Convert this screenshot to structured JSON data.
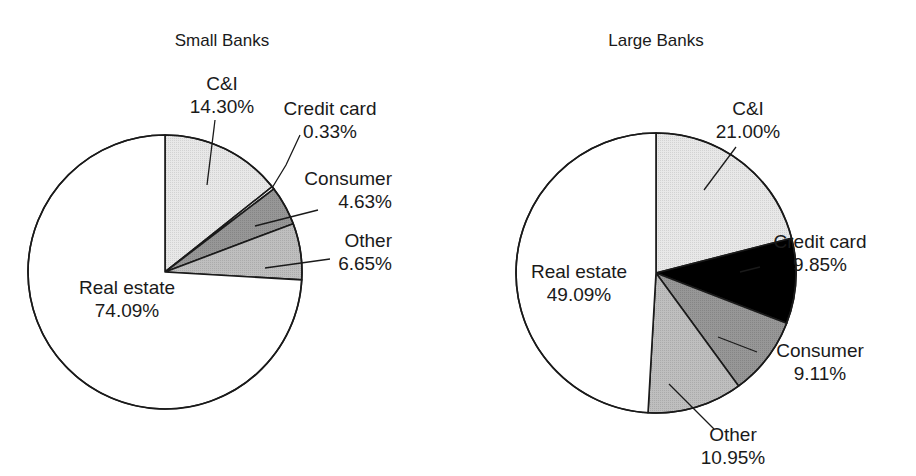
{
  "figure": {
    "background": "#ffffff",
    "outline_color": "#1a1a1a"
  },
  "charts": [
    {
      "id": "small-banks",
      "title": "Small Banks",
      "center": {
        "x": 165,
        "y": 272
      },
      "radius": 137,
      "start_angle_deg": 0,
      "slices": [
        {
          "label": "C&I",
          "value": 14.3,
          "value_text": "14.30%",
          "color": "#e4e4e4"
        },
        {
          "label": "Credit card",
          "value": 0.33,
          "value_text": "0.33%",
          "color": "#ffffff"
        },
        {
          "label": "Consumer",
          "value": 4.63,
          "value_text": "4.63%",
          "color": "#8f8f8f"
        },
        {
          "label": "Other",
          "value": 6.65,
          "value_text": "6.65%",
          "color": "#b9b9b9"
        },
        {
          "label": "Real estate",
          "value": 74.09,
          "value_text": "74.09%",
          "color": "#ffffff"
        }
      ],
      "labels": [
        {
          "name": "ci",
          "line1": "C&I",
          "line2": "14.30%",
          "x": 222,
          "y": 90,
          "anchor": "middle",
          "leader": [
            [
              215,
              120
            ],
            [
              207,
              185
            ]
          ]
        },
        {
          "name": "credit-card",
          "line1": "Credit card",
          "line2": "0.33%",
          "x": 330,
          "y": 115,
          "anchor": "middle",
          "leader": [
            [
              300,
              135
            ],
            [
              286,
              165
            ],
            [
              272,
              188
            ]
          ]
        },
        {
          "name": "consumer",
          "line1": "Consumer",
          "line2": "4.63%",
          "x": 392,
          "y": 185,
          "anchor": "end",
          "leader": [
            [
              318,
              210
            ],
            [
              255,
              226
            ]
          ]
        },
        {
          "name": "other",
          "line1": "Other",
          "line2": "6.65%",
          "x": 392,
          "y": 247,
          "anchor": "end",
          "leader": [
            [
              330,
              259
            ],
            [
              265,
              268
            ]
          ]
        },
        {
          "name": "real-estate",
          "line1": "Real estate",
          "line2": "74.09%",
          "x": 127,
          "y": 294,
          "anchor": "middle",
          "leader": null
        }
      ]
    },
    {
      "id": "large-banks",
      "title": "Large Banks",
      "center": {
        "x": 656,
        "y": 273
      },
      "radius": 140,
      "start_angle_deg": 0,
      "slices": [
        {
          "label": "C&I",
          "value": 21.0,
          "value_text": "21.00%",
          "color": "#e4e4e4"
        },
        {
          "label": "Credit card",
          "value": 9.85,
          "value_text": "9.85%",
          "color": "#000000"
        },
        {
          "label": "Consumer",
          "value": 9.11,
          "value_text": "9.11%",
          "color": "#8f8f8f"
        },
        {
          "label": "Other",
          "value": 10.95,
          "value_text": "10.95%",
          "color": "#b9b9b9"
        },
        {
          "label": "Real estate",
          "value": 49.09,
          "value_text": "49.09%",
          "color": "#ffffff"
        }
      ],
      "labels": [
        {
          "name": "ci",
          "line1": "C&I",
          "line2": "21.00%",
          "x": 748,
          "y": 115,
          "anchor": "middle",
          "leader": [
            [
              736,
              147
            ],
            [
              704,
              190
            ]
          ]
        },
        {
          "name": "credit-card",
          "line1": "Credit card",
          "line2": "9.85%",
          "x": 820,
          "y": 248,
          "anchor": "middle",
          "leader": [
            [
              760,
              267
            ],
            [
              740,
              272
            ]
          ]
        },
        {
          "name": "consumer",
          "line1": "Consumer",
          "line2": "9.11%",
          "x": 820,
          "y": 357,
          "anchor": "middle",
          "leader": [
            [
              757,
              352
            ],
            [
              718,
              337
            ]
          ]
        },
        {
          "name": "other",
          "line1": "Other",
          "line2": "10.95%",
          "x": 733,
          "y": 441,
          "anchor": "middle",
          "leader": [
            [
              714,
              429
            ],
            [
              669,
              384
            ]
          ]
        },
        {
          "name": "real-estate",
          "line1": "Real estate",
          "line2": "49.09%",
          "x": 579,
          "y": 278,
          "anchor": "middle",
          "leader": null
        }
      ]
    }
  ],
  "chart_data": {
    "type": "pie",
    "xlabel": "",
    "ylabel": "",
    "units": "percent",
    "legend": "none",
    "grid": false,
    "categories": [
      "C&I",
      "Credit card",
      "Consumer",
      "Other",
      "Real estate"
    ],
    "series": [
      {
        "name": "Small Banks",
        "values": [
          14.3,
          0.33,
          4.63,
          6.65,
          74.09
        ]
      },
      {
        "name": "Large Banks",
        "values": [
          21.0,
          9.85,
          9.11,
          10.95,
          49.09
        ]
      }
    ],
    "annotations": [
      "Small Banks: C&I 14.30%",
      "Small Banks: Credit card 0.33%",
      "Small Banks: Consumer 4.63%",
      "Small Banks: Other 6.65%",
      "Small Banks: Real estate 74.09%",
      "Large Banks: C&I 21.00%",
      "Large Banks: Credit card 9.85%",
      "Large Banks: Consumer 9.11%",
      "Large Banks: Other 10.95%",
      "Large Banks: Real estate 49.09%"
    ]
  }
}
